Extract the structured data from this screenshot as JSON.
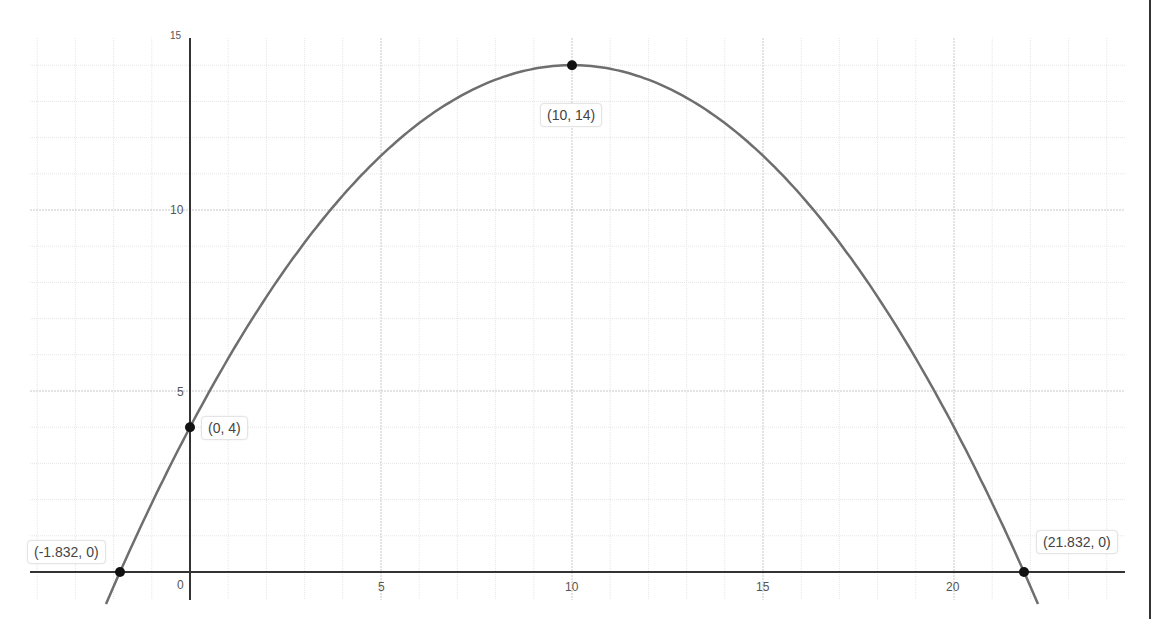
{
  "chart_data": {
    "type": "line",
    "title": "",
    "xlabel": "",
    "ylabel": "",
    "function": "y = -0.1(x - 10)^2 + 14",
    "xlim": [
      -5,
      24.5
    ],
    "ylim": [
      -0.5,
      15
    ],
    "grid": true,
    "x_ticks": [
      0,
      5,
      10,
      15,
      20
    ],
    "y_ticks": [
      5,
      10,
      15
    ],
    "points": [
      {
        "x": -1.832,
        "y": 0,
        "label": "(-1.832, 0)"
      },
      {
        "x": 0,
        "y": 4,
        "label": "(0, 4)"
      },
      {
        "x": 10,
        "y": 14,
        "label": "(10, 14)"
      },
      {
        "x": 21.832,
        "y": 0,
        "label": "(21.832, 0)"
      }
    ],
    "series": [
      {
        "name": "parabola",
        "x_range": [
          -2.2,
          22.2
        ],
        "color": "#6e6e6e"
      }
    ]
  },
  "labels": {
    "p1": "(-1.832, 0)",
    "p2": "(0, 4)",
    "p3": "(10, 14)",
    "p4": "(21.832, 0)"
  },
  "ticks": {
    "x0": "0",
    "x5": "5",
    "x10": "10",
    "x15": "15",
    "x20": "20",
    "y5": "5",
    "y10": "10",
    "y15": "15"
  },
  "colors": {
    "curve": "#6e6e6e",
    "axis": "#333333",
    "grid_major": "#c8c8c8",
    "grid_minor": "#e6e6e6",
    "point": "#111111"
  }
}
